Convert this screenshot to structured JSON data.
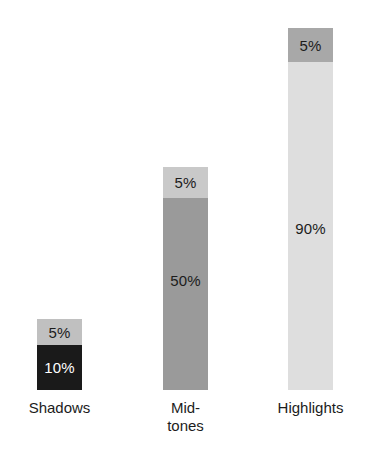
{
  "chart_data": {
    "type": "bar",
    "subtype": "stacked-bar",
    "title": "",
    "subtitle": "",
    "xlabel": "",
    "ylabel": "",
    "grid": false,
    "legend": false,
    "categories": [
      "Shadows",
      "Mid-\ntones",
      "Highlights"
    ],
    "category_labels_plain": [
      "Shadows",
      "Mid-tones",
      "Highlights"
    ],
    "series": [
      {
        "name": "main",
        "values": [
          10,
          50,
          90
        ],
        "value_labels": [
          "10%",
          "5 0%",
          "90%"
        ]
      },
      {
        "name": "cap",
        "values": [
          5,
          5,
          5
        ],
        "value_labels": [
          "5%",
          "5%",
          "5%"
        ]
      }
    ],
    "ylim": [
      0,
      100
    ],
    "bars": [
      {
        "category": "Shadows",
        "category_label": "Shadows",
        "cap": {
          "value": 5,
          "label": "5%",
          "fill": "#c0c0c0",
          "text_color": "#1c1c1c",
          "height_px": 26
        },
        "body": {
          "value": 10,
          "label": "10%",
          "fill": "#1a1a1a",
          "text_color": "#ffffff",
          "height_px": 45
        },
        "width_px": 45,
        "left_px": 37
      },
      {
        "category": "Mid-tones",
        "category_label": "Mid-\ntones",
        "cap": {
          "value": 5,
          "label": "5%",
          "fill": "#c9c9c9",
          "text_color": "#1c1c1c",
          "height_px": 31
        },
        "body": {
          "value": 50,
          "label": "50%",
          "fill": "#9a9a9a",
          "text_color": "#1c1c1c",
          "height_px": 192
        },
        "width_px": 45,
        "left_px": 163
      },
      {
        "category": "Highlights",
        "category_label": "Highlights",
        "cap": {
          "value": 5,
          "label": "5%",
          "fill": "#a8a8a8",
          "text_color": "#1c1c1c",
          "height_px": 34
        },
        "body": {
          "value": 90,
          "label": "90%",
          "fill": "#dedede",
          "text_color": "#1c1c1c",
          "height_px": 328
        },
        "width_px": 45,
        "left_px": 288
      }
    ]
  },
  "colors": {
    "background": "#ffffff",
    "text": "#1c1c1c",
    "shadows_body": "#1a1a1a",
    "shadows_cap": "#c0c0c0",
    "midtones_body": "#9a9a9a",
    "midtones_cap": "#c9c9c9",
    "highlights_body": "#dedede",
    "highlights_cap": "#a8a8a8"
  }
}
